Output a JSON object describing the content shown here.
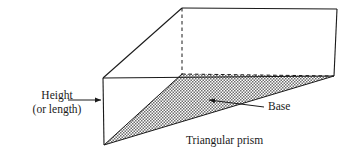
{
  "figure": {
    "caption": "Triangular prism",
    "labels": {
      "height_line1": "Height",
      "height_line2": "(or length)",
      "base": "Base"
    },
    "colors": {
      "stroke": "#1a1a1a",
      "hatch": "#6e6e6e",
      "background": "#ffffff",
      "text": "#1a1a1a"
    },
    "geometry": {
      "type": "triangular-prism",
      "front_top_apex": [
        103,
        78
      ],
      "front_bottom_vertex": [
        104,
        145
      ],
      "back_top_apex": [
        182,
        8
      ],
      "back_hidden_vertex": [
        182,
        74
      ],
      "right_top_vertex": [
        337,
        9
      ],
      "right_bottom_vertex": [
        334,
        76
      ],
      "base_face": [
        [
          104,
          145
        ],
        [
          182,
          74
        ],
        [
          334,
          76
        ]
      ],
      "hidden_edges": [
        [
          [
            182,
            8
          ],
          [
            182,
            74
          ]
        ],
        [
          [
            182,
            74
          ],
          [
            334,
            76
          ]
        ]
      ]
    },
    "annotations": {
      "height_arrow": {
        "from": [
          68,
          100
        ],
        "to": [
          103,
          100
        ],
        "points": "right"
      },
      "base_arrow": {
        "from": [
          264,
          106
        ],
        "to": [
          207,
          99
        ],
        "points": "up-left"
      }
    }
  }
}
